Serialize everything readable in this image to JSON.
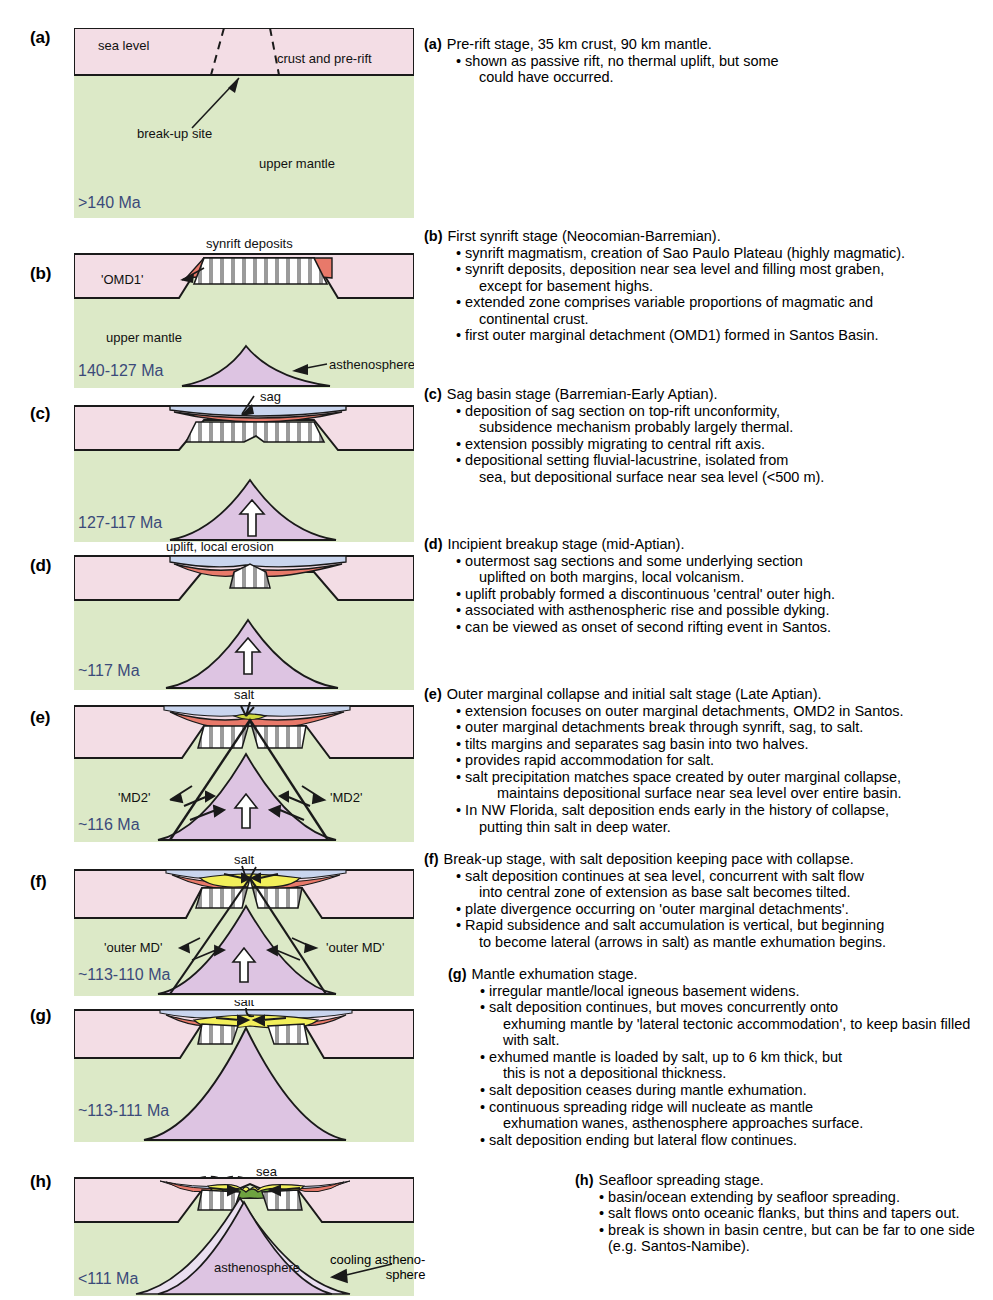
{
  "figure": {
    "colors": {
      "crust": "#f3dde5",
      "mantle": "#dce9c7",
      "asthenosphere": "#ddc4e2",
      "synrift_red": "#e8796a",
      "salt_yellow": "#f2ef5a",
      "sag_blue": "#c9d5ee",
      "sea_white": "#ffffff",
      "oceanic_green": "#6ea340",
      "age_text": "#3b4a7a",
      "outline": "#1a1a1a",
      "hatch_grey": "#9b9b9b"
    }
  },
  "panels": [
    {
      "id": "a",
      "label": "(a)",
      "age": ">140 Ma",
      "annotations": [
        "sea level",
        "crust and pre-rift",
        "break-up site",
        "upper mantle"
      ]
    },
    {
      "id": "b",
      "label": "(b)",
      "age": "140-127 Ma",
      "annotations": [
        "synrift deposits",
        "'OMD1'",
        "upper mantle",
        "asthenosphere"
      ]
    },
    {
      "id": "c",
      "label": "(c)",
      "age": "127-117 Ma",
      "annotations": [
        "sag"
      ]
    },
    {
      "id": "d",
      "label": "(d)",
      "age": "~117 Ma",
      "annotations": [
        "uplift, local erosion"
      ]
    },
    {
      "id": "e",
      "label": "(e)",
      "age": "~116 Ma",
      "annotations": [
        "salt",
        "'MD2'",
        "'MD2'"
      ]
    },
    {
      "id": "f",
      "label": "(f)",
      "age": "~113-110 Ma",
      "annotations": [
        "salt",
        "'outer MD'",
        "'outer MD'"
      ]
    },
    {
      "id": "g",
      "label": "(g)",
      "age": "~113-111 Ma",
      "annotations": [
        "salt"
      ]
    },
    {
      "id": "h",
      "label": "(h)",
      "age": "<111 Ma",
      "annotations": [
        "sea",
        "asthenosphere",
        "cooling astheno-",
        "sphere"
      ]
    }
  ],
  "captions": [
    {
      "id": "a",
      "tag": "(a)",
      "title": "Pre-rift stage, 35 km crust, 90 km mantle.",
      "bullets": [
        {
          "text": "shown as passive rift, no thermal uplift, but some",
          "cont": "could have occurred."
        }
      ]
    },
    {
      "id": "b",
      "tag": "(b)",
      "title": "First synrift stage (Neocomian-Barremian).",
      "bullets": [
        {
          "text": "synrift magmatism, creation of Sao Paulo Plateau (highly magmatic)."
        },
        {
          "text": "synrift deposits, deposition near sea level and filling most graben,",
          "cont": "except for basement highs."
        },
        {
          "text": "extended zone comprises variable proportions of magmatic and",
          "cont": "continental crust."
        },
        {
          "text": "first outer marginal detachment (OMD1) formed in Santos Basin."
        }
      ]
    },
    {
      "id": "c",
      "tag": "(c)",
      "title": "Sag basin stage (Barremian-Early Aptian).",
      "bullets": [
        {
          "text": "deposition of sag section on top-rift unconformity,",
          "cont": "subsidence mechanism probably largely thermal."
        },
        {
          "text": "extension possibly migrating to central rift axis."
        },
        {
          "text": "depositional setting fluvial-lacustrine, isolated from",
          "cont": "sea, but depositional surface near sea level (<500 m)."
        }
      ]
    },
    {
      "id": "d",
      "tag": "(d)",
      "title": "Incipient breakup stage (mid-Aptian).",
      "bullets": [
        {
          "text": "outermost sag sections and some underlying section",
          "cont": "uplifted on both margins, local volcanism."
        },
        {
          "text": "uplift probably formed a discontinuous 'central' outer high."
        },
        {
          "text": "associated with asthenospheric rise and possible dyking."
        },
        {
          "text": "can be viewed as onset of second rifting event in Santos."
        }
      ]
    },
    {
      "id": "e",
      "tag": "(e)",
      "title": "Outer marginal collapse and initial salt stage (Late Aptian).",
      "bullets": [
        {
          "text": "extension focuses on outer marginal detachments, OMD2 in Santos."
        },
        {
          "text": "outer marginal detachments break through synrift, sag, to salt."
        },
        {
          "text": "tilts margins and separates sag basin into two halves."
        },
        {
          "text": "provides rapid accommodation for salt."
        },
        {
          "text": "salt precipitation matches space created by outer marginal collapse,",
          "cont": "maintains depositional surface near sea level over entire basin."
        },
        {
          "text": "In NW Florida, salt deposition ends early in the history of collapse,",
          "cont": "putting thin salt in deep water."
        }
      ]
    },
    {
      "id": "f",
      "tag": "(f)",
      "title": "Break-up stage, with salt deposition keeping pace with collapse.",
      "bullets": [
        {
          "text": "salt deposition continues at sea level, concurrent with salt flow",
          "cont": "into central zone of extension as base salt becomes tilted."
        },
        {
          "text": "plate divergence occurring on 'outer marginal detachments'."
        },
        {
          "text": "Rapid subsidence and salt accumulation is vertical, but beginning",
          "cont": "to become lateral (arrows in salt) as mantle exhumation begins."
        }
      ]
    },
    {
      "id": "g",
      "tag": "(g)",
      "title": "Mantle exhumation stage.",
      "bullets": [
        {
          "text": "irregular mantle/local igneous basement widens."
        },
        {
          "text": "salt deposition continues, but moves concurrently onto",
          "cont": "exhuming mantle by 'lateral tectonic accommodation', to keep basin filled with salt."
        },
        {
          "text": "exhumed mantle is loaded by salt, up to 6 km thick, but",
          "cont": "this is not a depositional thickness."
        },
        {
          "text": "salt deposition ceases during mantle exhumation."
        },
        {
          "text": "continuous spreading ridge will nucleate as mantle",
          "cont": "exhumation wanes, asthenosphere approaches surface."
        },
        {
          "text": "salt deposition ending but lateral flow continues."
        }
      ]
    },
    {
      "id": "h",
      "tag": "(h)",
      "title": "Seafloor spreading stage.",
      "bullets": [
        {
          "text": "basin/ocean extending by seafloor spreading."
        },
        {
          "text": "salt flows onto oceanic flanks, but thins and tapers out."
        },
        {
          "text": "break is shown in basin centre, but can be far to one side (e.g. Santos-Namibe)."
        }
      ]
    }
  ]
}
